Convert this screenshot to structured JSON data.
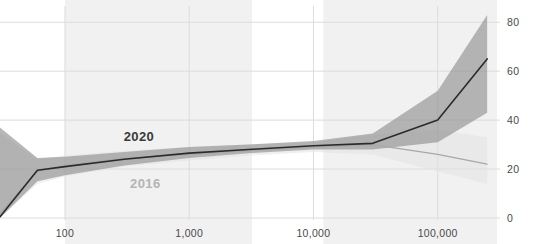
{
  "chart_data": {
    "type": "line",
    "title": "",
    "xlabel": "",
    "ylabel": "",
    "x_scale": "log",
    "xlim": [
      30,
      300000
    ],
    "ylim": [
      0,
      85
    ],
    "grid": true,
    "x_ticks": [
      "100",
      "1,000",
      "10,000",
      "100,000"
    ],
    "x_tick_values": [
      100,
      1000,
      10000,
      100000
    ],
    "y_ticks": [
      "0",
      "20",
      "40",
      "60",
      "80"
    ],
    "y_tick_values": [
      0,
      20,
      40,
      60,
      80
    ],
    "legend_position": "inline-annotation",
    "annotations": [
      {
        "text": "2020",
        "x": 320,
        "y": 33,
        "color": "#3a3a3a"
      },
      {
        "text": "2016",
        "x": 360,
        "y": 14,
        "color": "#b4b4b4"
      }
    ],
    "series": [
      {
        "name": "2020",
        "color": "#2b2b2b",
        "band_color": "#8c8c8c",
        "x": [
          30,
          60,
          100,
          300,
          1000,
          3000,
          10000,
          30000,
          100000,
          250000
        ],
        "values": [
          0.5,
          19.5,
          21.0,
          24.0,
          26.5,
          28.0,
          29.5,
          30.5,
          40.0,
          65.0
        ],
        "band_low": [
          0.0,
          15.0,
          17.5,
          21.5,
          24.5,
          26.5,
          28.0,
          28.0,
          31.0,
          43.0
        ],
        "band_high": [
          37.0,
          24.5,
          25.0,
          27.0,
          29.0,
          30.0,
          31.5,
          34.5,
          52.0,
          83.0
        ]
      },
      {
        "name": "2016",
        "color": "#a8a8a8",
        "band_color": "#e2e2e2",
        "x": [
          30,
          60,
          100,
          300,
          1000,
          3000,
          10000,
          30000,
          100000,
          250000
        ],
        "values": [
          2.0,
          19.0,
          21.5,
          24.5,
          26.0,
          27.5,
          29.0,
          30.0,
          26.0,
          22.0
        ],
        "band_low": [
          0.0,
          14.0,
          17.0,
          21.0,
          23.5,
          25.5,
          27.0,
          26.0,
          19.0,
          14.0
        ],
        "band_high": [
          35.0,
          24.0,
          25.5,
          27.5,
          29.0,
          30.0,
          31.0,
          34.0,
          36.0,
          33.0
        ]
      }
    ],
    "background_bands": [
      {
        "x_start": 100,
        "x_end": 3200
      },
      {
        "x_start": 12000,
        "x_end": 600000
      }
    ]
  },
  "axes": {
    "y_tick_color": "#4a4a4a",
    "x_tick_color": "#4a4a4a",
    "grid_color": "#dcdcdc",
    "band_fill": "#f1f1f1"
  }
}
